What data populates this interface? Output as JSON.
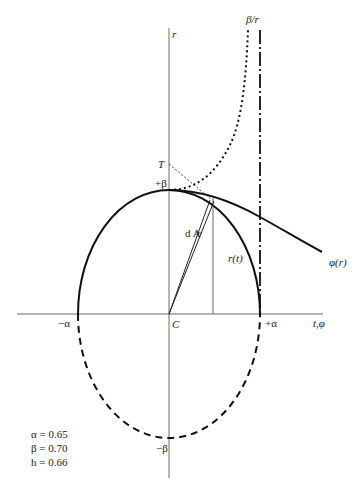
{
  "diagram": {
    "axes": {
      "vertical_label": "r",
      "horizontal_label": "t,φ",
      "origin_label": "C"
    },
    "labels": {
      "beta_over_r": "β/r",
      "T": "T",
      "plus_beta": "+β",
      "minus_beta": "−β",
      "plus_alpha": "+α",
      "minus_alpha": "−α",
      "dA": "d A",
      "r_t": "r(t)",
      "phi_r": "φ(r)"
    },
    "parameters": [
      {
        "symbol": "α",
        "text": "α = 0.65"
      },
      {
        "symbol": "β",
        "text": "β = 0.70"
      },
      {
        "symbol": "h",
        "text": "h = 0.66"
      }
    ],
    "curves": [
      {
        "name": "upper-half-ellipse",
        "style": "solid-thick"
      },
      {
        "name": "lower-half-ellipse",
        "style": "dashed"
      },
      {
        "name": "beta-over-r",
        "style": "dotted"
      },
      {
        "name": "phi-of-r",
        "style": "solid-thick"
      },
      {
        "name": "alpha-asymptote",
        "style": "dash-dot"
      },
      {
        "name": "tangent-to-T",
        "style": "dotted-thin"
      }
    ],
    "line_color": "#111111"
  }
}
